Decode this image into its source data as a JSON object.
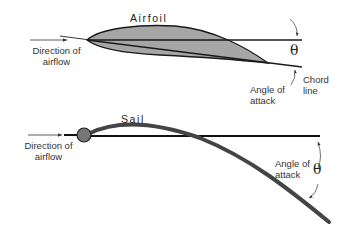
{
  "airfoil_diagram": {
    "title": "Airfoil",
    "direction_label_line1": "Direction of",
    "direction_label_line2": "airflow",
    "theta": "θ",
    "angle_label_line1": "Angle of",
    "angle_label_line2": "attack",
    "chord_label_line1": "Chord",
    "chord_label_line2": "line",
    "fill_color": "#a6a6a6",
    "stroke_color": "#1a1a1a"
  },
  "sail_diagram": {
    "title": "Sail",
    "direction_label_line1": "Direction of",
    "direction_label_line2": "airflow",
    "angle_label_line1": "Angle of",
    "angle_label_line2": "attack",
    "theta": "θ",
    "mast_color": "#777777",
    "sail_color": "#444444"
  }
}
